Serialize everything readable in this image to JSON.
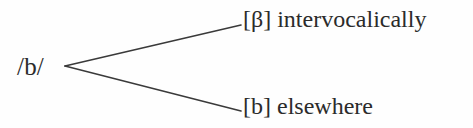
{
  "figure": {
    "type": "phonological-rule-branching-diagram",
    "background_color": "#fefefe",
    "line_color": "#3a3a3a",
    "text_color": "#2b2b2b"
  },
  "root": {
    "label": "/b/"
  },
  "branches": [
    {
      "id": "upper",
      "label": "[β] intervocalically",
      "allophone": "[β]",
      "environment": "intervocalically"
    },
    {
      "id": "lower",
      "label": "[b] elsewhere",
      "allophone": "[b]",
      "environment": "elsewhere"
    }
  ],
  "geometry": {
    "vertex": {
      "x": 65,
      "y": 66
    },
    "upper_end": {
      "x": 241,
      "y": 25
    },
    "lower_end": {
      "x": 241,
      "y": 111
    }
  }
}
